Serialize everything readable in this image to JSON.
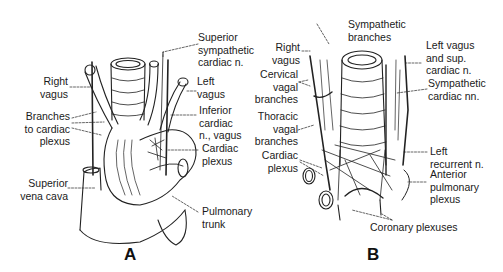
{
  "figure": {
    "panels": [
      {
        "id": "A",
        "letter": "A",
        "labels": [
          {
            "key": "superior_sympathetic_cardiac_n",
            "text": "Superior\nsympathetic\ncardiac n."
          },
          {
            "key": "right_vagus",
            "text": "Right\nvagus"
          },
          {
            "key": "left_vagus",
            "text": "Left\nvagus"
          },
          {
            "key": "branches_to_cardiac_plexus",
            "text": "Branches\nto cardiac\nplexus"
          },
          {
            "key": "inferior_cardiac_n_vagus",
            "text": "Inferior\ncardiac\nn., vagus"
          },
          {
            "key": "cardiac_plexus",
            "text": "Cardiac\nplexus"
          },
          {
            "key": "superior_vena_cava",
            "text": "Superior\nvena cava"
          },
          {
            "key": "pulmonary_trunk",
            "text": "Pulmonary\ntrunk"
          }
        ]
      },
      {
        "id": "B",
        "letter": "B",
        "labels": [
          {
            "key": "sympathetic_branches",
            "text": "Sympathetic\nbranches"
          },
          {
            "key": "right_vagus",
            "text": "Right\nvagus"
          },
          {
            "key": "left_vagus_sup_cardiac_n",
            "text": "Left vagus\nand sup.\ncardiac n."
          },
          {
            "key": "cervical_vagal_branches",
            "text": "Cervical\nvagal\nbranches"
          },
          {
            "key": "sympathetic_cardiac_nn",
            "text": "Sympathetic\ncardiac nn."
          },
          {
            "key": "thoracic_vagal_branches",
            "text": "Thoracic\nvagal\nbranches"
          },
          {
            "key": "cardiac_plexus",
            "text": "Cardiac\nplexus"
          },
          {
            "key": "left_recurrent_n",
            "text": "Left\nrecurrent n."
          },
          {
            "key": "anterior_pulmonary_plexus",
            "text": "Anterior\npulmonary\nplexus"
          },
          {
            "key": "coronary_plexuses",
            "text": "Coronary plexuses"
          }
        ]
      }
    ]
  }
}
